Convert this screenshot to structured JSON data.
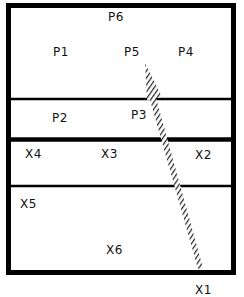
{
  "diagram": {
    "type": "section-layout",
    "colors": {
      "line": "#000000",
      "background": "#ffffff",
      "hatch": "#222222"
    },
    "upper_region_labels": [
      {
        "id": "P6",
        "text": "P6",
        "x": 108,
        "y": 10
      },
      {
        "id": "P1",
        "text": "P1",
        "x": 53,
        "y": 45
      },
      {
        "id": "P5",
        "text": "P5",
        "x": 124,
        "y": 45
      },
      {
        "id": "P4",
        "text": "P4",
        "x": 178,
        "y": 45
      },
      {
        "id": "P2",
        "text": "P2",
        "x": 52,
        "y": 111
      },
      {
        "id": "P3",
        "text": "P3",
        "x": 131,
        "y": 108
      }
    ],
    "lower_region_labels": [
      {
        "id": "X4",
        "text": "X4",
        "x": 25,
        "y": 147
      },
      {
        "id": "X3",
        "text": "X3",
        "x": 101,
        "y": 147
      },
      {
        "id": "X2",
        "text": "X2",
        "x": 195,
        "y": 148
      },
      {
        "id": "X5",
        "text": "X5",
        "x": 20,
        "y": 197
      },
      {
        "id": "X6",
        "text": "X6",
        "x": 106,
        "y": 243
      },
      {
        "id": "X1",
        "text": "X1",
        "x": 195,
        "y": 283
      }
    ]
  }
}
